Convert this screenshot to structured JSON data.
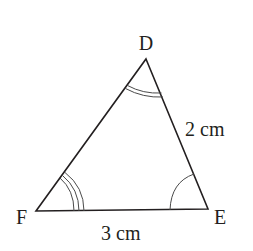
{
  "diagram": {
    "type": "triangle",
    "stroke_color": "#231f20",
    "arc_color": "#4a4a4a",
    "background": "#ffffff",
    "vertices": {
      "D": {
        "label": "D",
        "x": 146,
        "y": 59
      },
      "E": {
        "label": "E",
        "x": 208,
        "y": 209
      },
      "F": {
        "label": "F",
        "x": 36,
        "y": 211
      }
    },
    "sides": [
      {
        "name": "DE",
        "label": "2 cm"
      },
      {
        "name": "FE",
        "label": "3 cm"
      }
    ],
    "angle_marks": [
      {
        "vertex": "D",
        "arcs": 2
      },
      {
        "vertex": "F",
        "arcs": 3
      },
      {
        "vertex": "E",
        "arcs": 1
      }
    ]
  }
}
